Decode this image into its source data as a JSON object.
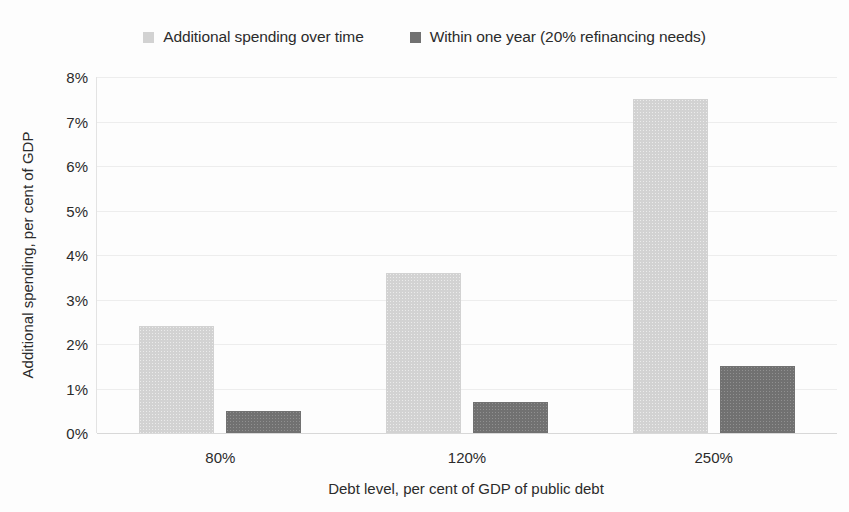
{
  "chart_data": {
    "type": "bar",
    "title": "",
    "subtitle": "",
    "xlabel": "Debt level, per cent of GDP of public debt",
    "ylabel": "Additional spending, per cent of GDP",
    "categories": [
      "80%",
      "120%",
      "250%"
    ],
    "series": [
      {
        "name": "Additional spending over time",
        "color": "#d2d2d2",
        "values": [
          2.4,
          3.6,
          7.5
        ]
      },
      {
        "name": "Within one year (20% refinancing needs)",
        "color": "#717171",
        "values": [
          0.5,
          0.7,
          1.5
        ]
      }
    ],
    "ylim": [
      0,
      8
    ],
    "ytick_labels": [
      "0%",
      "1%",
      "2%",
      "3%",
      "4%",
      "5%",
      "6%",
      "7%",
      "8%"
    ],
    "ytick_values": [
      0,
      1,
      2,
      3,
      4,
      5,
      6,
      7,
      8
    ],
    "grid": true,
    "grid_axis": "y",
    "legend_position": "top-center",
    "value_suffix": "%"
  },
  "legend": {
    "entries": [
      {
        "label": "Additional spending over time",
        "swatch_color": "#d2d2d2",
        "icon": "legend-swatch-icon"
      },
      {
        "label": "Within one year (20% refinancing needs)",
        "swatch_color": "#717171",
        "icon": "legend-swatch-icon"
      }
    ]
  },
  "axes": {
    "y_title": "Additional spending, per cent of GDP",
    "x_title": "Debt level, per cent of GDP of public debt"
  }
}
